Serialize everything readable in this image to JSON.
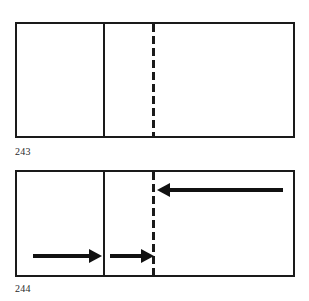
{
  "page": {
    "background_color": "#ffffff",
    "line_color": "#1a1a1a",
    "arrow_color": "#111111",
    "width": 309,
    "height": 301
  },
  "figures": [
    {
      "id": "figure-243",
      "caption": "243",
      "description": "Rectangle divided by a solid vertical crease and a dashed vertical fold line",
      "rect": {
        "x": 15,
        "y": 22,
        "width": 280,
        "height": 116
      },
      "solid_divider": {
        "x": 103,
        "y": 22,
        "height": 116
      },
      "dashed_divider": {
        "x": 152,
        "y": 24,
        "height": 112
      },
      "arrows": [],
      "caption_position": {
        "x": 15,
        "y": 146
      }
    },
    {
      "id": "figure-244",
      "caption": "244",
      "description": "Same rectangle with three motion arrows showing the fold direction",
      "rect": {
        "x": 15,
        "y": 170,
        "width": 280,
        "height": 107
      },
      "solid_divider": {
        "x": 103,
        "y": 170,
        "height": 107
      },
      "dashed_divider": {
        "x": 152,
        "y": 172,
        "height": 103
      },
      "arrows": [
        {
          "name": "arrow-upper-left-pointing",
          "direction": "left",
          "x": 157,
          "y": 183,
          "length": 126
        },
        {
          "name": "arrow-lower-left-segment-right-pointing",
          "direction": "right",
          "x": 33,
          "y": 249,
          "length": 69
        },
        {
          "name": "arrow-lower-middle-segment-right-pointing",
          "direction": "right",
          "x": 110,
          "y": 249,
          "length": 44
        }
      ],
      "caption_position": {
        "x": 15,
        "y": 283
      }
    }
  ]
}
